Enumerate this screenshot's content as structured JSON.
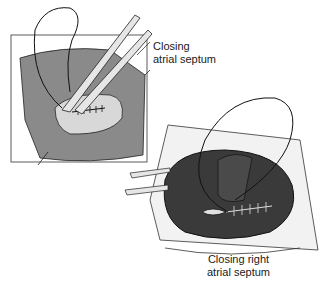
{
  "figure": {
    "panel_top_left": {
      "description": "Closing atrial septum through atriotomy, sutures placed",
      "label_line1": "Closing",
      "label_line2": "atrial septum"
    },
    "panel_bottom_right": {
      "description": "Closing right atriotomy with running suture",
      "label_line1": "Closing right",
      "label_line2": "atrial septum"
    },
    "colors": {
      "tissue_dark": "#3a3a3a",
      "tissue_mid": "#7a7a7a",
      "tissue_light": "#d6d6d6",
      "line": "#1a1a1a",
      "background": "#ffffff"
    }
  }
}
